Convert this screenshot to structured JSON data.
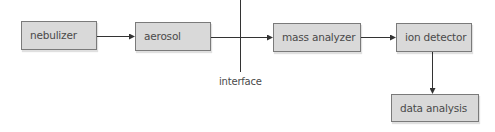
{
  "diagram": {
    "type": "flowchart",
    "title": "",
    "nodes": [
      {
        "id": "nebulizer",
        "label": "nebulizer"
      },
      {
        "id": "aerosol",
        "label": "aerosol"
      },
      {
        "id": "mass_analyzer",
        "label": "mass analyzer"
      },
      {
        "id": "ion_detector",
        "label": "ion detector"
      },
      {
        "id": "data_analysis",
        "label": "data analysis"
      }
    ],
    "edges": [
      {
        "from": "nebulizer",
        "to": "aerosol"
      },
      {
        "from": "aerosol",
        "to": "mass_analyzer"
      },
      {
        "from": "mass_analyzer",
        "to": "ion_detector"
      },
      {
        "from": "ion_detector",
        "to": "data_analysis"
      }
    ],
    "annotations": [
      {
        "id": "interface",
        "label": "interface",
        "kind": "vertical-divider"
      }
    ],
    "colors": {
      "box_fill": "#d9d9d9",
      "box_border": "#7a7a7a",
      "line": "#333333",
      "text": "#4a4a4a"
    }
  }
}
